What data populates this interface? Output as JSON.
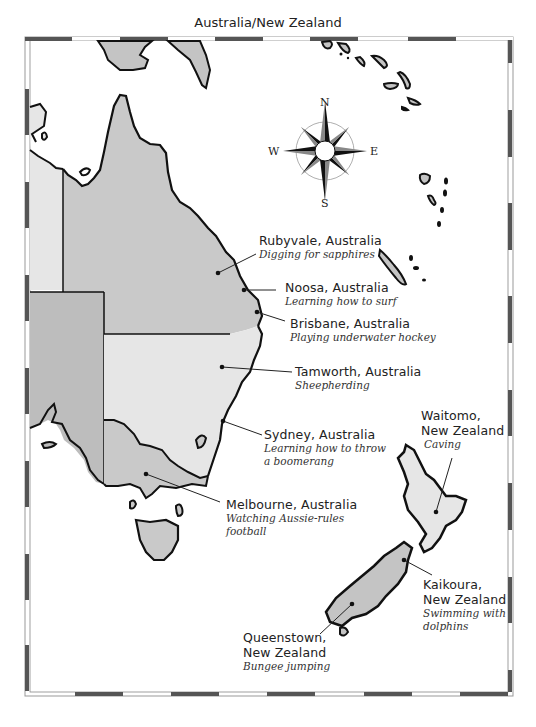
{
  "title": "Australia/New Zealand",
  "compass": {
    "n": "N",
    "s": "S",
    "e": "E",
    "w": "W"
  },
  "colors": {
    "land_gray": "#c4c4c4",
    "land_light": "#e2e2e2",
    "land_mid": "#bdbdbd",
    "outline": "#111111",
    "border_dark": "#555555"
  },
  "locations": [
    {
      "city": "Rubyvale, Australia",
      "activity": "Digging for sapphires"
    },
    {
      "city": "Noosa, Australia",
      "activity": "Learning how to surf"
    },
    {
      "city": "Brisbane, Australia",
      "activity": "Playing underwater hockey"
    },
    {
      "city": "Tamworth, Australia",
      "activity": "Sheepherding"
    },
    {
      "city": "Sydney, Australia",
      "activity": "Learning how to throw a boomerang"
    },
    {
      "city": "Melbourne, Australia",
      "activity": "Watching Aussie-rules football"
    },
    {
      "city": "Waitomo, New Zealand",
      "activity": "Caving"
    },
    {
      "city": "Kaikoura, New Zealand",
      "activity": "Swimming with dolphins"
    },
    {
      "city": "Queenstown, New Zealand",
      "activity": "Bungee jumping"
    }
  ]
}
